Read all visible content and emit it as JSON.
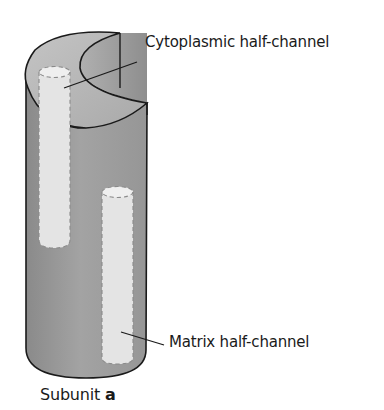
{
  "figure": {
    "labels": {
      "cytoplasmic": "Cytoplasmic half-channel",
      "matrix": "Matrix half-channel"
    },
    "caption": {
      "prefix": "Subunit ",
      "bold": "a"
    },
    "colors": {
      "cylinder_dark": "#8f8f8f",
      "cylinder_mid": "#a6a6a6",
      "cylinder_top": "#b9b9b9",
      "channel_fill": "#e6e6e6",
      "outline": "#1a1a1a"
    }
  }
}
